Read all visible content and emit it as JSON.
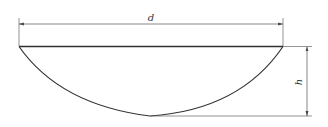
{
  "diagram": {
    "labels": {
      "diameter": "d",
      "height": "h"
    },
    "colors": {
      "stroke": "#333333",
      "dim": "#555555"
    }
  }
}
